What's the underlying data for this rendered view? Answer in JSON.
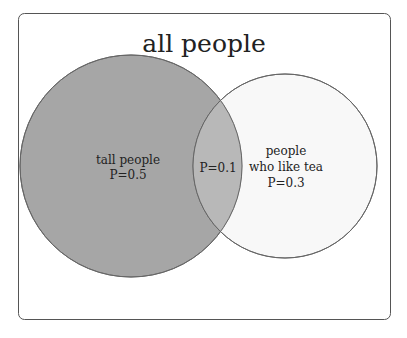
{
  "title": "all people",
  "sets": [
    {
      "label": "tall people",
      "probability": "P=0.5",
      "fill": "#a6a6a6"
    },
    {
      "label_line1": "people",
      "label_line2": "who like tea",
      "probability": "P=0.3",
      "fill": "#f2f2f2"
    }
  ],
  "intersection": {
    "probability": "P=0.1",
    "fill": "#b8b8b8"
  },
  "colors": {
    "border": "#555555",
    "background": "#ffffff"
  }
}
